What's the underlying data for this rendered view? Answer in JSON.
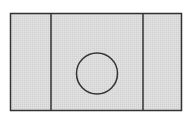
{
  "diagram": {
    "colors": {
      "background": "#ffffff",
      "fill": "#d9d9d9",
      "stroke": "#333333"
    },
    "outer_rect": {
      "x": 10.5,
      "y": 13.5,
      "width": 171,
      "height": 97
    },
    "dividers": [
      {
        "x": 51
      },
      {
        "x": 143
      }
    ],
    "panels": [
      {
        "name": "left-panel"
      },
      {
        "name": "center-panel"
      },
      {
        "name": "right-panel"
      }
    ],
    "circle": {
      "cx": 97,
      "cy": 73.5,
      "r": 20.5
    }
  }
}
